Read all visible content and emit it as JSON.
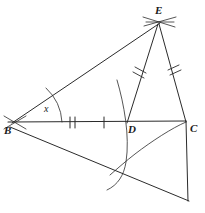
{
  "diagram": {
    "kind": "geometric-construction",
    "canvas": {
      "width": 205,
      "height": 213,
      "background": "#ffffff"
    },
    "stroke_color": "#2b2b2b",
    "points": [
      {
        "name": "B",
        "label": "B",
        "x": 12,
        "y": 123,
        "label_x": 6,
        "label_y": 126
      },
      {
        "name": "D",
        "label": "D",
        "x": 128,
        "y": 122,
        "label_x": 128,
        "label_y": 125
      },
      {
        "name": "C",
        "label": "C",
        "x": 186,
        "y": 121,
        "label_x": 190,
        "label_y": 124
      },
      {
        "name": "E",
        "label": "E",
        "x": 158,
        "y": 22,
        "label_x": 156,
        "label_y": 8
      },
      {
        "name": "F",
        "label": "",
        "x": 188,
        "y": 200,
        "label_x": 0,
        "label_y": 0
      }
    ],
    "segments": [
      {
        "name": "segment-BE",
        "from": "B",
        "to": "E"
      },
      {
        "name": "segment-BC",
        "from": "B",
        "to": "C"
      },
      {
        "name": "segment-ED",
        "from": "E",
        "to": "D"
      },
      {
        "name": "segment-EC",
        "from": "E",
        "to": "C"
      },
      {
        "name": "segment-BF",
        "from": "B",
        "to": "F"
      },
      {
        "name": "segment-CF",
        "from": "C",
        "to": "F"
      }
    ],
    "tick_marks": [
      {
        "name": "tick-BD-double",
        "segment": "BD",
        "count": 2,
        "x": 72,
        "y": 122
      },
      {
        "name": "tick-BD-single",
        "segment": "BD",
        "count": 1,
        "x": 104,
        "y": 122
      },
      {
        "name": "tick-ED-double",
        "segment": "ED",
        "count": 2,
        "x": 140,
        "y": 71
      },
      {
        "name": "tick-EC-double",
        "segment": "EC",
        "count": 2,
        "x": 174,
        "y": 71
      }
    ],
    "angle_marks": [
      {
        "name": "angle-x-at-B",
        "label": "x",
        "vertex": "B",
        "label_x": 44,
        "label_y": 108
      }
    ],
    "construction_arcs": [
      {
        "name": "arc-through-D-vertical",
        "note": "compass arc crossing baseline at D"
      },
      {
        "name": "arc-from-C-sweep",
        "note": "compass arc swung from C toward lower left"
      },
      {
        "name": "arc-crossmark-at-E",
        "note": "intersecting compass arcs locating E"
      },
      {
        "name": "arc-crossmark-at-B",
        "note": "intersecting compass arcs at B"
      }
    ]
  }
}
